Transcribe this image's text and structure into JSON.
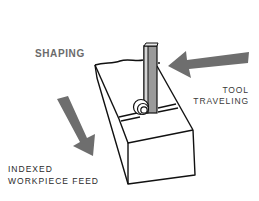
{
  "figure": {
    "labels": {
      "shaping": "SHAPING",
      "tool_traveling": [
        "TOOL",
        "TRAVELING"
      ],
      "indexed_feed": [
        "INDEXED",
        "WORKPIECE FEED"
      ]
    },
    "elements": {
      "workpiece": "rectangular-block",
      "tool": "vertical-shaping-tool",
      "chip": "curled-chip",
      "tool_arrow_direction": "left",
      "feed_arrow_direction": "down-right"
    },
    "colors": {
      "background": "#ffffff",
      "outline": "#111111",
      "arrow": "#6e6e6e",
      "tool_fill": "#9a9a9a",
      "shaping_text": "#6b6b6b",
      "body_text": "#2a2a2a"
    }
  }
}
